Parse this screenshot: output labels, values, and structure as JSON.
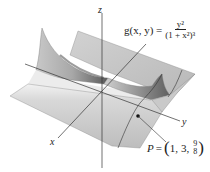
{
  "figure": {
    "type": "3d-surface-plot",
    "function_label": {
      "lhs": "g(x, y) =",
      "numerator": "y²",
      "denominator": "(1 + x²)³"
    },
    "axes": {
      "x": "x",
      "y": "y",
      "z": "z"
    },
    "point": {
      "name": "P",
      "eq": "=",
      "x": "1,",
      "y": "3,",
      "z_numerator": "9",
      "z_denominator": "8"
    },
    "colors": {
      "surface_light": "#e6e6e6",
      "surface_mid": "#bdbdbd",
      "surface_dark": "#6e6e6e",
      "axis": "#333333",
      "text": "#222222"
    }
  }
}
